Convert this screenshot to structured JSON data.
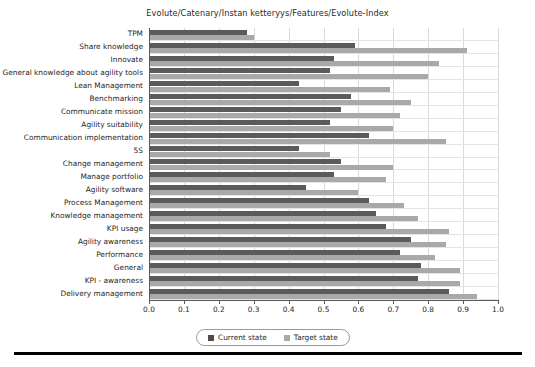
{
  "chart_data": {
    "type": "bar",
    "orientation": "horizontal",
    "title": "Evolute/Catenary/Instan ketteryys/Features/Evolute-Index",
    "xlabel": "",
    "ylabel": "",
    "xlim": [
      0.0,
      1.0
    ],
    "xticks": [
      "0.0",
      "0.1",
      "0.2",
      "0.3",
      "0.4",
      "0.5",
      "0.6",
      "0.7",
      "0.8",
      "0.9",
      "1.0"
    ],
    "grid": true,
    "legend_position": "bottom-center",
    "categories": [
      "TPM",
      "Share knowledge",
      "Innovate",
      "General knowledge about agility tools",
      "Lean Management",
      "Benchmarking",
      "Communicate mission",
      "Agility suitability",
      "Communication implementation",
      "5S",
      "Change management",
      "Manage portfolio",
      "Agility software",
      "Process Management",
      "Knowledge management",
      "KPI usage",
      "Agility awareness",
      "Performance",
      "General",
      "KPI - awareness",
      "Delivery management"
    ],
    "series": [
      {
        "name": "Current state",
        "color": "#5b5b5b",
        "values": [
          0.28,
          0.59,
          0.53,
          0.52,
          0.43,
          0.58,
          0.55,
          0.52,
          0.63,
          0.43,
          0.55,
          0.53,
          0.45,
          0.63,
          0.65,
          0.68,
          0.75,
          0.72,
          0.78,
          0.77,
          0.86
        ]
      },
      {
        "name": "Target state",
        "color": "#a9a9a9",
        "values": [
          0.3,
          0.91,
          0.83,
          0.8,
          0.69,
          0.75,
          0.72,
          0.7,
          0.85,
          0.52,
          0.7,
          0.68,
          0.6,
          0.73,
          0.77,
          0.86,
          0.85,
          0.82,
          0.89,
          0.89,
          0.94
        ]
      }
    ]
  },
  "legend": {
    "items": [
      {
        "label": "Current state",
        "swatch": "legend-swatch-current"
      },
      {
        "label": "Target state",
        "swatch": "legend-swatch-target"
      }
    ]
  }
}
